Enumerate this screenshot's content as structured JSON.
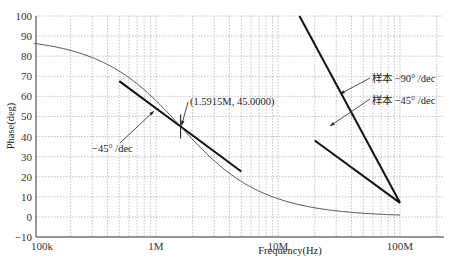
{
  "chart_data": {
    "type": "line",
    "title": "",
    "xlabel": "Frequency(Hz)",
    "ylabel": "Phase(deg)",
    "xscale": "log",
    "xlim": [
      100000,
      250000000
    ],
    "ylim": [
      -10,
      100
    ],
    "grid": true,
    "x_ticks": [
      "100k",
      "1M",
      "10M",
      "100M"
    ],
    "y_ticks": [
      "-10",
      "0",
      "10",
      "20",
      "30",
      "40",
      "50",
      "60",
      "70",
      "80",
      "90",
      "100"
    ],
    "series": [
      {
        "name": "Phase response",
        "x": [
          100000,
          200000,
          500000,
          1000000,
          1591500,
          2000000,
          5000000,
          10000000,
          20000000,
          50000000,
          100000000
        ],
        "values": [
          86.4,
          82.8,
          72.4,
          57.9,
          45.0,
          38.5,
          17.7,
          9.0,
          4.5,
          1.8,
          0.9
        ]
      },
      {
        "name": "-45°/dec asymptote",
        "x": [
          500000,
          1591500,
          5000000
        ],
        "values": [
          67.6,
          45.0,
          22.6
        ]
      },
      {
        "name": "样本 -90°/dec",
        "x": [
          15000000,
          100000000
        ],
        "values": [
          100,
          7
        ]
      },
      {
        "name": "样本 -45°/dec",
        "x": [
          20000000,
          100000000
        ],
        "values": [
          38,
          7
        ]
      }
    ],
    "annotations": [
      {
        "text": "(1.5915M, 45.0000)",
        "x": 1591500,
        "y": 45.0
      },
      {
        "text": "-45° /dec"
      },
      {
        "text": "样本-90° /dec"
      },
      {
        "text": "样本-45° /dec"
      }
    ]
  },
  "labels": {
    "xlabel": "Frequency(Hz)",
    "ylabel": "Phase(deg)",
    "point": "(1.5915M, 45.0000)",
    "slope45": "−45° /dec",
    "sample90": "样本 −90° /dec",
    "sample45": "样本 −45° /dec"
  }
}
